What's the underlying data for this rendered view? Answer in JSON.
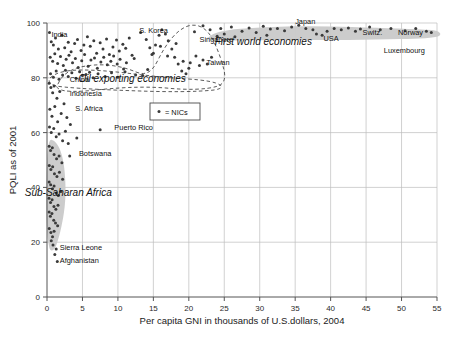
{
  "chart_data": {
    "type": "scatter",
    "title": "",
    "xlabel": "Per capita GNI in thousands of U.S.dollars, 2004",
    "ylabel": "PQLI as of 2001",
    "xlim": [
      0,
      55
    ],
    "ylim": [
      0,
      100
    ],
    "xticks": [
      0,
      5,
      10,
      15,
      20,
      25,
      30,
      35,
      40,
      45,
      50,
      55
    ],
    "yticks": [
      0,
      20,
      40,
      60,
      80,
      100
    ],
    "xtick_labels": [
      "0",
      "5",
      "10",
      "15",
      "20",
      "25",
      "30",
      "35",
      "40",
      "45",
      "50",
      "55"
    ],
    "ytick_labels": [
      "0",
      "20",
      "40",
      "60",
      "80",
      "100"
    ],
    "grid": true,
    "legend": {
      "position": "inside-left",
      "entries": [
        {
          "marker": "dot",
          "label": "= NICs"
        }
      ]
    },
    "annotations": [
      {
        "text": "First world economies",
        "x": 30.5,
        "y": 92.0,
        "style": "italic"
      },
      {
        "text": "Oil exporting economies",
        "x": 12.0,
        "y": 78.5,
        "style": "italic"
      },
      {
        "text": "Sub-Saharan Africa",
        "x": 3.0,
        "y": 37.0,
        "style": "italic"
      }
    ],
    "point_labels": [
      {
        "label": "India",
        "x": 0.62,
        "y": 95.0,
        "anchor": "start"
      },
      {
        "label": "S. Korea",
        "x": 13.0,
        "y": 96.5,
        "anchor": "start"
      },
      {
        "label": "Singapore",
        "x": 21.5,
        "y": 93.0,
        "anchor": "start"
      },
      {
        "label": "Japan",
        "x": 35.0,
        "y": 99.5,
        "anchor": "start"
      },
      {
        "label": "USA",
        "x": 39.0,
        "y": 93.5,
        "anchor": "start"
      },
      {
        "label": "Switz.",
        "x": 44.5,
        "y": 95.5,
        "anchor": "start"
      },
      {
        "label": "Norway",
        "x": 49.5,
        "y": 95.5,
        "anchor": "start"
      },
      {
        "label": "Luxembourg",
        "x": 47.5,
        "y": 89.0,
        "anchor": "start"
      },
      {
        "label": "Taiwan",
        "x": 22.5,
        "y": 84.5,
        "anchor": "start"
      },
      {
        "label": "China",
        "x": 3.2,
        "y": 78.5,
        "anchor": "start"
      },
      {
        "label": "Indonesia",
        "x": 3.2,
        "y": 73.5,
        "anchor": "start"
      },
      {
        "label": "S. Africa",
        "x": 4.0,
        "y": 68.0,
        "anchor": "start"
      },
      {
        "label": "Puerto Rico",
        "x": 9.5,
        "y": 61.0,
        "anchor": "start"
      },
      {
        "label": "Botswana",
        "x": 4.5,
        "y": 51.5,
        "anchor": "start"
      },
      {
        "label": "Sierra Leone",
        "x": 1.8,
        "y": 17.0,
        "anchor": "start"
      },
      {
        "label": "Afghanistan",
        "x": 1.8,
        "y": 12.5,
        "anchor": "start"
      }
    ],
    "points": [
      [
        0.35,
        96.5
      ],
      [
        0.6,
        93.2
      ],
      [
        0.9,
        92.0
      ],
      [
        1.2,
        94.5
      ],
      [
        1.6,
        90.5
      ],
      [
        2.1,
        95.5
      ],
      [
        2.5,
        91.0
      ],
      [
        3.0,
        93.0
      ],
      [
        3.4,
        89.5
      ],
      [
        3.9,
        92.5
      ],
      [
        4.3,
        94.0
      ],
      [
        4.8,
        90.0
      ],
      [
        5.2,
        92.0
      ],
      [
        5.7,
        95.0
      ],
      [
        6.1,
        91.5
      ],
      [
        6.6,
        93.5
      ],
      [
        7.0,
        89.0
      ],
      [
        7.5,
        92.8
      ],
      [
        7.9,
        90.5
      ],
      [
        8.4,
        94.2
      ],
      [
        8.8,
        88.5
      ],
      [
        9.3,
        91.2
      ],
      [
        9.8,
        93.8
      ],
      [
        10.2,
        89.8
      ],
      [
        10.7,
        92.2
      ],
      [
        11.1,
        90.8
      ],
      [
        11.6,
        94.5
      ],
      [
        12.0,
        88.2
      ],
      [
        0.45,
        87.5
      ],
      [
        0.8,
        86.0
      ],
      [
        1.1,
        88.8
      ],
      [
        1.5,
        85.2
      ],
      [
        1.9,
        87.8
      ],
      [
        2.3,
        84.5
      ],
      [
        2.7,
        86.8
      ],
      [
        3.1,
        88.2
      ],
      [
        3.6,
        85.5
      ],
      [
        4.0,
        87.0
      ],
      [
        4.4,
        83.8
      ],
      [
        4.9,
        86.2
      ],
      [
        5.3,
        88.5
      ],
      [
        5.8,
        84.2
      ],
      [
        6.2,
        86.5
      ],
      [
        6.7,
        87.2
      ],
      [
        7.1,
        83.5
      ],
      [
        7.6,
        85.8
      ],
      [
        8.0,
        87.5
      ],
      [
        8.5,
        84.8
      ],
      [
        9.0,
        86.0
      ],
      [
        9.4,
        88.0
      ],
      [
        9.9,
        85.0
      ],
      [
        10.3,
        86.8
      ],
      [
        10.8,
        83.2
      ],
      [
        11.2,
        85.5
      ],
      [
        12.3,
        87.0
      ],
      [
        0.5,
        81.5
      ],
      [
        0.9,
        80.2
      ],
      [
        1.3,
        82.5
      ],
      [
        1.7,
        79.5
      ],
      [
        2.2,
        81.0
      ],
      [
        2.6,
        82.8
      ],
      [
        3.0,
        80.5
      ],
      [
        3.5,
        81.8
      ],
      [
        4.1,
        79.8
      ],
      [
        4.6,
        82.2
      ],
      [
        5.0,
        80.8
      ],
      [
        5.5,
        81.2
      ],
      [
        6.0,
        82.0
      ],
      [
        6.5,
        80.0
      ],
      [
        7.2,
        81.5
      ],
      [
        8.2,
        80.5
      ],
      [
        9.1,
        81.8
      ],
      [
        10.0,
        80.2
      ],
      [
        11.0,
        82.2
      ],
      [
        12.5,
        81.0
      ],
      [
        13.5,
        80.8
      ],
      [
        14.2,
        83.0
      ],
      [
        14.8,
        88.5
      ],
      [
        15.3,
        92.0
      ],
      [
        15.8,
        95.5
      ],
      [
        16.2,
        97.5
      ],
      [
        16.7,
        96.0
      ],
      [
        17.1,
        93.5
      ],
      [
        17.6,
        90.5
      ],
      [
        18.0,
        87.5
      ],
      [
        18.5,
        85.0
      ],
      [
        19.0,
        82.5
      ],
      [
        19.6,
        81.5
      ],
      [
        20.2,
        85.5
      ],
      [
        21.0,
        88.0
      ],
      [
        13.2,
        96.5
      ],
      [
        14.0,
        94.0
      ],
      [
        14.5,
        91.0
      ],
      [
        15.0,
        89.0
      ],
      [
        16.0,
        91.5
      ],
      [
        17.0,
        88.0
      ],
      [
        18.2,
        92.5
      ],
      [
        19.2,
        86.0
      ],
      [
        20.0,
        83.5
      ],
      [
        21.5,
        84.5
      ],
      [
        22.0,
        86.5
      ],
      [
        22.6,
        85.0
      ],
      [
        23.2,
        87.5
      ],
      [
        0.3,
        78.0
      ],
      [
        0.55,
        76.5
      ],
      [
        0.8,
        74.5
      ],
      [
        1.0,
        77.0
      ],
      [
        1.4,
        72.5
      ],
      [
        1.8,
        75.0
      ],
      [
        2.4,
        70.5
      ],
      [
        0.4,
        68.5
      ],
      [
        0.7,
        66.0
      ],
      [
        1.1,
        69.5
      ],
      [
        1.5,
        64.0
      ],
      [
        2.0,
        67.0
      ],
      [
        2.8,
        65.5
      ],
      [
        3.3,
        63.0
      ],
      [
        0.35,
        62.0
      ],
      [
        0.6,
        60.0
      ],
      [
        0.95,
        61.5
      ],
      [
        1.3,
        58.5
      ],
      [
        1.7,
        59.5
      ],
      [
        2.2,
        57.0
      ],
      [
        3.0,
        56.0
      ],
      [
        0.3,
        55.0
      ],
      [
        0.5,
        53.5
      ],
      [
        0.75,
        54.5
      ],
      [
        1.0,
        52.0
      ],
      [
        1.35,
        50.5
      ],
      [
        1.7,
        51.5
      ],
      [
        2.1,
        49.0
      ],
      [
        0.32,
        48.0
      ],
      [
        0.55,
        46.5
      ],
      [
        0.8,
        47.5
      ],
      [
        1.05,
        45.0
      ],
      [
        1.4,
        44.0
      ],
      [
        1.75,
        45.5
      ],
      [
        2.2,
        43.0
      ],
      [
        0.3,
        42.0
      ],
      [
        0.52,
        41.0
      ],
      [
        0.78,
        39.5
      ],
      [
        1.0,
        40.5
      ],
      [
        1.3,
        38.0
      ],
      [
        1.6,
        37.0
      ],
      [
        1.95,
        38.5
      ],
      [
        0.28,
        36.0
      ],
      [
        0.5,
        34.5
      ],
      [
        0.72,
        35.5
      ],
      [
        0.98,
        33.0
      ],
      [
        1.25,
        32.0
      ],
      [
        1.55,
        33.5
      ],
      [
        0.3,
        31.0
      ],
      [
        0.48,
        29.5
      ],
      [
        0.7,
        30.5
      ],
      [
        0.95,
        28.0
      ],
      [
        1.2,
        27.0
      ],
      [
        1.5,
        26.0
      ],
      [
        0.32,
        25.0
      ],
      [
        0.55,
        23.5
      ],
      [
        0.78,
        22.0
      ],
      [
        1.0,
        24.0
      ],
      [
        0.6,
        20.5
      ],
      [
        0.85,
        19.0
      ],
      [
        1.3,
        17.5
      ],
      [
        1.1,
        15.5
      ],
      [
        1.45,
        13.0
      ],
      [
        7.5,
        61.0
      ],
      [
        3.2,
        51.5
      ],
      [
        4.2,
        58.0
      ],
      [
        2.6,
        60.5
      ],
      [
        22.0,
        99.0
      ],
      [
        23.0,
        97.5
      ],
      [
        24.5,
        98.0
      ],
      [
        26.0,
        98.5
      ],
      [
        27.5,
        97.0
      ],
      [
        28.5,
        98.2
      ],
      [
        29.5,
        96.5
      ],
      [
        30.5,
        98.8
      ],
      [
        31.5,
        97.8
      ],
      [
        32.5,
        98.0
      ],
      [
        33.5,
        97.2
      ],
      [
        34.5,
        98.5
      ],
      [
        35.5,
        99.2
      ],
      [
        36.5,
        98.0
      ],
      [
        37.5,
        97.5
      ],
      [
        38.0,
        96.0
      ],
      [
        38.8,
        95.5
      ],
      [
        39.5,
        97.0
      ],
      [
        40.5,
        98.0
      ],
      [
        41.5,
        97.5
      ],
      [
        42.5,
        98.2
      ],
      [
        43.5,
        97.0
      ],
      [
        44.2,
        97.8
      ],
      [
        45.5,
        98.5
      ],
      [
        47.0,
        97.5
      ],
      [
        48.5,
        98.0
      ],
      [
        50.5,
        97.2
      ],
      [
        52.0,
        98.0
      ],
      [
        53.5,
        97.0
      ],
      [
        54.2,
        96.5
      ],
      [
        25.0,
        96.0
      ],
      [
        26.5,
        95.0
      ],
      [
        31.0,
        95.5
      ],
      [
        20.8,
        96.8
      ],
      [
        24.0,
        95.2
      ]
    ],
    "regions": [
      {
        "name": "first-world-blob",
        "kind": "shaded",
        "color": "#c9c9c9"
      },
      {
        "name": "sub-saharan-blob",
        "kind": "shaded",
        "color": "#c9c9c9"
      },
      {
        "name": "nics-outline",
        "kind": "dashed"
      },
      {
        "name": "oil-exporters-outline",
        "kind": "dashed"
      }
    ]
  },
  "colors": {
    "grid": "#bdbdbd",
    "axis": "#555555",
    "marker": "#3a3a3a",
    "blob": "#c9c9c9",
    "text": "#111111"
  }
}
